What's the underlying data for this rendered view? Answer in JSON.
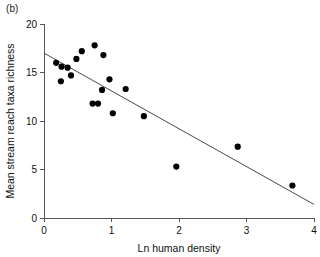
{
  "figure": {
    "panel_label": "(b)"
  },
  "chart_data": {
    "type": "scatter",
    "title": "",
    "subtitle": "",
    "xlabel": "Ln human density",
    "ylabel": "Mean stream reach taxa richness",
    "xlim": [
      0,
      4
    ],
    "ylim": [
      0,
      20
    ],
    "xticks": [
      0,
      1,
      2,
      3,
      4
    ],
    "xticklabels": [
      "0",
      "1",
      "2",
      "3",
      "4"
    ],
    "yticks": [
      0,
      5,
      10,
      15,
      20
    ],
    "yticklabels": [
      "0",
      "5",
      "10",
      "15",
      "20"
    ],
    "grid": false,
    "legend": null,
    "marker": "filled-circle",
    "marker_color": "#000000",
    "points": [
      {
        "x": 0.18,
        "y": 16.0
      },
      {
        "x": 0.25,
        "y": 14.1
      },
      {
        "x": 0.26,
        "y": 15.6
      },
      {
        "x": 0.35,
        "y": 15.5
      },
      {
        "x": 0.4,
        "y": 14.7
      },
      {
        "x": 0.48,
        "y": 16.4
      },
      {
        "x": 0.56,
        "y": 17.2
      },
      {
        "x": 0.72,
        "y": 11.8
      },
      {
        "x": 0.75,
        "y": 17.8
      },
      {
        "x": 0.8,
        "y": 11.8
      },
      {
        "x": 0.86,
        "y": 13.2
      },
      {
        "x": 0.88,
        "y": 16.8
      },
      {
        "x": 0.97,
        "y": 14.3
      },
      {
        "x": 1.02,
        "y": 10.8
      },
      {
        "x": 1.21,
        "y": 13.3
      },
      {
        "x": 1.48,
        "y": 10.5
      },
      {
        "x": 1.96,
        "y": 5.3
      },
      {
        "x": 2.87,
        "y": 7.35
      },
      {
        "x": 3.68,
        "y": 3.35
      }
    ],
    "trend_line": {
      "type": "linear-fit",
      "color": "#4a4a4a",
      "x_start": 0,
      "y_start": 17.0,
      "x_end": 4.0,
      "y_end": 1.4
    }
  }
}
